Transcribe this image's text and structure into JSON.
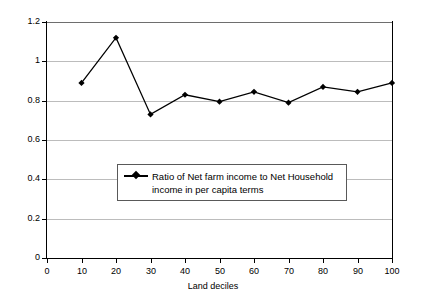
{
  "chart_data": {
    "type": "line",
    "title": "",
    "xlabel": "Land deciles",
    "ylabel": "",
    "x": [
      10,
      20,
      30,
      40,
      50,
      60,
      70,
      80,
      90,
      100
    ],
    "categories": [
      "10",
      "20",
      "30",
      "40",
      "50",
      "60",
      "70",
      "80",
      "90",
      "100"
    ],
    "series": [
      {
        "name": "Ratio of Net farm income to Net Household income in per capita terms",
        "values": [
          0.89,
          1.12,
          0.73,
          0.83,
          0.795,
          0.845,
          0.79,
          0.87,
          0.845,
          0.89
        ],
        "marker": "diamond",
        "color": "#000000"
      }
    ],
    "xlim": [
      0,
      100
    ],
    "ylim": [
      0,
      1.2
    ],
    "x_ticks": [
      "0",
      "10",
      "20",
      "30",
      "40",
      "50",
      "60",
      "70",
      "80",
      "90",
      "100"
    ],
    "x_tick_values": [
      0,
      10,
      20,
      30,
      40,
      50,
      60,
      70,
      80,
      90,
      100
    ],
    "y_ticks": [
      "0",
      "0.2",
      "0.4",
      "0.6",
      "0.8",
      "1",
      "1.2"
    ],
    "y_tick_values": [
      0,
      0.2,
      0.4,
      0.6,
      0.8,
      1.0,
      1.2
    ],
    "grid": true,
    "grid_axis": "y",
    "grid_color": "#bcbcbc",
    "legend_position": "inside-center-lower",
    "background": "#ffffff",
    "axis_color": "#000000"
  },
  "legend": {
    "entries": [
      {
        "line1": "Ratio of Net farm income to Net Household",
        "line2": "income in per capita terms"
      }
    ]
  }
}
